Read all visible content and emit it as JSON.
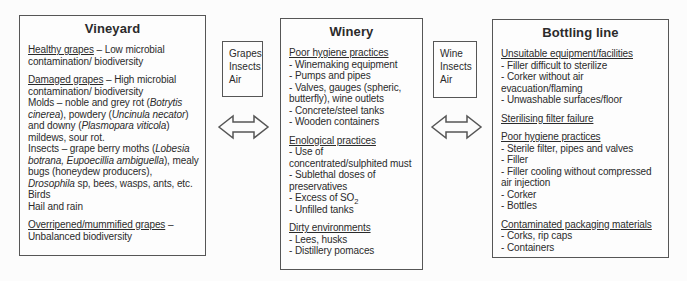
{
  "diagram": {
    "background_color": "#fcfcfc",
    "box_border_color": "#565656",
    "text_color": "#2b2b2b",
    "stages": [
      {
        "title": "Vineyard",
        "paragraphs": [
          {
            "seg": [
              {
                "t": "Healthy grapes",
                "u": 1
              },
              {
                "t": " – Low microbial contamination/ biodiversity"
              }
            ]
          },
          {
            "gap": 1,
            "seg": [
              {
                "t": "Damaged grapes",
                "u": 1
              },
              {
                "t": " – High microbial contamination/ biodiversity"
              }
            ]
          },
          {
            "seg": [
              {
                "t": "Molds – noble and grey rot ("
              },
              {
                "t": "Botrytis cinerea",
                "i": 1
              },
              {
                "t": "), powdery ("
              },
              {
                "t": "Uncinula necator",
                "i": 1
              },
              {
                "t": ") and downy ("
              },
              {
                "t": "Plasmopara viticola",
                "i": 1
              },
              {
                "t": ") mildews, sour rot."
              }
            ]
          },
          {
            "seg": [
              {
                "t": "Insects – grape berry moths ("
              },
              {
                "t": "Lobesia botrana, Eupoecillia ambiguella",
                "i": 1
              },
              {
                "t": "), mealy bugs (honeydew producers), "
              },
              {
                "t": "Drosophila",
                "i": 1
              },
              {
                "t": " sp, bees, wasps, ants, etc."
              }
            ]
          },
          {
            "seg": [
              {
                "t": "Birds"
              }
            ]
          },
          {
            "seg": [
              {
                "t": "Hail and rain"
              }
            ]
          },
          {
            "gap": 1,
            "seg": [
              {
                "t": "Overripened/mummified grapes",
                "u": 1
              },
              {
                "t": " – Unbalanced biodiversity"
              }
            ]
          }
        ]
      },
      {
        "title": "Winery",
        "paragraphs": [
          {
            "seg": [
              {
                "t": "Poor hygiene practices",
                "u": 1
              }
            ]
          },
          {
            "seg": [
              {
                "t": "- Winemaking equipment"
              }
            ]
          },
          {
            "seg": [
              {
                "t": "- Pumps and pipes"
              }
            ]
          },
          {
            "seg": [
              {
                "t": "- Valves, gauges (spheric, butterfly), wine outlets"
              }
            ]
          },
          {
            "seg": [
              {
                "t": "- Concrete/steel tanks"
              }
            ]
          },
          {
            "seg": [
              {
                "t": "- Wooden containers"
              }
            ]
          },
          {
            "gap": 1,
            "seg": [
              {
                "t": "Enological practices",
                "u": 1
              }
            ]
          },
          {
            "seg": [
              {
                "t": "- Use of concentrated/sulphited must"
              }
            ]
          },
          {
            "seg": [
              {
                "t": "- Sublethal doses of preservatives"
              }
            ]
          },
          {
            "seg": [
              {
                "t": "- Excess of SO"
              },
              {
                "t": "2",
                "s": 1
              }
            ]
          },
          {
            "seg": [
              {
                "t": "- Unfilled tanks"
              }
            ]
          },
          {
            "gap": 1,
            "seg": [
              {
                "t": "Dirty environments",
                "u": 1
              }
            ]
          },
          {
            "seg": [
              {
                "t": "- Lees, husks"
              }
            ]
          },
          {
            "seg": [
              {
                "t": "- Distillery pomaces"
              }
            ]
          }
        ]
      },
      {
        "title": "Bottling line",
        "paragraphs": [
          {
            "seg": [
              {
                "t": "Unsuitable equipment/facilities",
                "u": 1
              }
            ]
          },
          {
            "seg": [
              {
                "t": "- Filler difficult to sterilize"
              }
            ]
          },
          {
            "seg": [
              {
                "t": "- Corker without air evacuation/flaming"
              }
            ]
          },
          {
            "seg": [
              {
                "t": "- Unwashable surfaces/floor"
              }
            ]
          },
          {
            "gap": 1,
            "seg": [
              {
                "t": "Sterilising filter failure",
                "u": 1
              }
            ]
          },
          {
            "gap": 1,
            "seg": [
              {
                "t": "Poor hygiene practices",
                "u": 1
              }
            ]
          },
          {
            "seg": [
              {
                "t": "- Sterile filter, pipes and valves"
              }
            ]
          },
          {
            "seg": [
              {
                "t": "- Filler"
              }
            ]
          },
          {
            "seg": [
              {
                "t": "- Filler cooling without compressed air injection"
              }
            ]
          },
          {
            "seg": [
              {
                "t": "- Corker"
              }
            ]
          },
          {
            "seg": [
              {
                "t": "- Bottles"
              }
            ]
          },
          {
            "gap": 1,
            "seg": [
              {
                "t": "Contaminated packaging materials",
                "u": 1
              }
            ]
          },
          {
            "seg": [
              {
                "t": "- Corks, rip caps"
              }
            ]
          },
          {
            "seg": [
              {
                "t": "- Containers"
              }
            ]
          }
        ]
      }
    ],
    "connectors": [
      {
        "label": "Grapes\nInsects\nAir",
        "arrow": "double-headed-horizontal"
      },
      {
        "label": "Wine\nInsects\nAir",
        "arrow": "double-headed-horizontal"
      }
    ]
  }
}
